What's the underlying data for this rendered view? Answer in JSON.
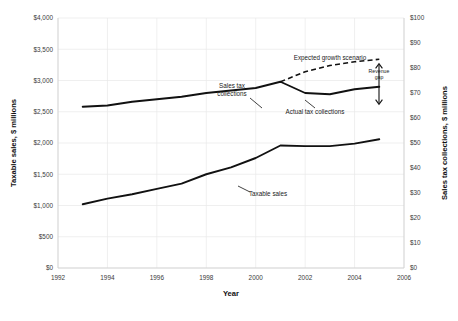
{
  "chart_data": {
    "type": "line",
    "title": "",
    "xlabel": "Year",
    "ylabel": "Taxable sales, $ millions",
    "y2label": "Sales tax collections, $ millions",
    "xlim": [
      1992,
      2006
    ],
    "ylim": [
      0,
      4000
    ],
    "y2lim": [
      0,
      100
    ],
    "grid": true,
    "legend": "none (inline annotations)",
    "x_ticks": [
      "1992",
      "1994",
      "1996",
      "1998",
      "2000",
      "2002",
      "2004",
      "2006"
    ],
    "x_tick_values": [
      1992,
      1994,
      1996,
      1998,
      2000,
      2002,
      2004,
      2006
    ],
    "y_ticks": [
      "$0",
      "$500",
      "$1,000",
      "$1,500",
      "$2,000",
      "$2,500",
      "$3,000",
      "$3,500",
      "$4,000"
    ],
    "y_tick_values": [
      0,
      500,
      1000,
      1500,
      2000,
      2500,
      3000,
      3500,
      4000
    ],
    "y2_ticks": [
      "$0",
      "$10",
      "$20",
      "$30",
      "$40",
      "$50",
      "$60",
      "$70",
      "$80",
      "$90",
      "$100"
    ],
    "y2_tick_values": [
      0,
      10,
      20,
      30,
      40,
      50,
      60,
      70,
      80,
      90,
      100
    ],
    "x": [
      1993,
      1994,
      1995,
      1996,
      1997,
      1998,
      1999,
      2000,
      2001,
      2002,
      2003,
      2004,
      2005
    ],
    "series": [
      {
        "name": "Taxable sales",
        "axis": "left",
        "style": "solid",
        "marker": "diamond",
        "values": [
          1020,
          1110,
          1180,
          1265,
          1350,
          1500,
          1610,
          1760,
          1960,
          1950,
          1950,
          1990,
          2060
        ]
      },
      {
        "name": "Sales tax collections",
        "axis": "right",
        "style": "solid",
        "marker": "diamond",
        "values": [
          64.5,
          65.0,
          66.5,
          67.5,
          68.5,
          70.0,
          71.0,
          72.0,
          74.5,
          70.0,
          69.5,
          71.5,
          72.5
        ]
      },
      {
        "name": "Expected growth scenario",
        "axis": "right",
        "style": "dashed",
        "marker": "none",
        "x": [
          2001,
          2002,
          2003,
          2004,
          2005
        ],
        "values": [
          74.5,
          78.5,
          81.0,
          82.5,
          83.5
        ]
      }
    ],
    "annotations": [
      {
        "name": "sales-tax-collections-label",
        "text": "Sales tax collections",
        "lines": [
          "Sales tax",
          "collections"
        ],
        "x": 232,
        "y": 88
      },
      {
        "name": "actual-tax-collections-label",
        "text": "Actual tax collections",
        "lines": [
          "Actual tax collections"
        ],
        "x": 315,
        "y": 114
      },
      {
        "name": "taxable-sales-label",
        "text": "Taxable sales",
        "lines": [
          "Taxable sales"
        ],
        "x": 268,
        "y": 196
      },
      {
        "name": "expected-growth-scenario-label",
        "text": "Expected growth scenario",
        "lines": [
          "Expected growth scenario"
        ],
        "x": 330,
        "y": 60
      },
      {
        "name": "revenue-gap-label",
        "text": "Revenue gap",
        "lines": [
          "Revenue",
          "gap"
        ],
        "x": 379,
        "y": 73
      }
    ],
    "colors": {
      "line": "#111111",
      "grid": "#e8e8e8",
      "text": "#1a1a1a",
      "background": "#ffffff"
    }
  }
}
